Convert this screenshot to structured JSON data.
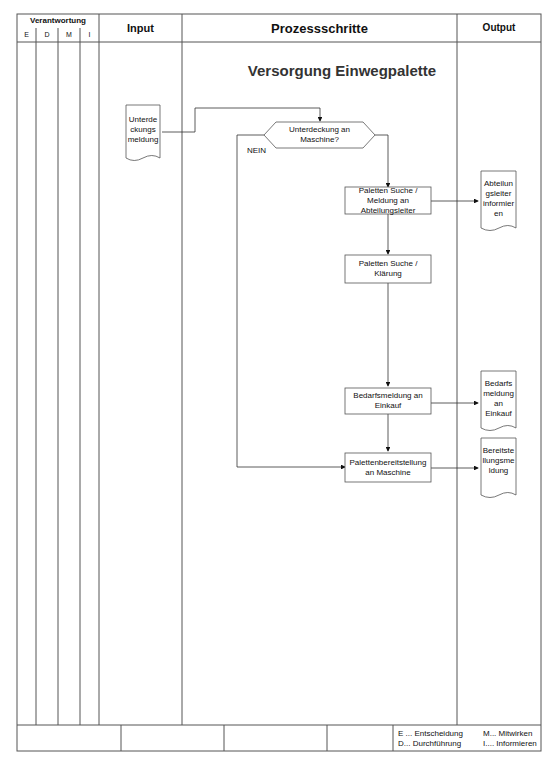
{
  "header": {
    "responsibility": "Verantwortung",
    "roles": [
      "E",
      "D",
      "M",
      "I"
    ],
    "input": "Input",
    "process": "Prozessschritte",
    "output": "Output"
  },
  "diagram": {
    "title": "Versorgung Einwegpalette",
    "input_document": "Unterde ckungs meldung",
    "decision": "Unterdeckung an Maschine?",
    "decision_no_label": "NEIN",
    "steps": [
      "Paletten Suche / Meldung an Abteilungsleiter",
      "Paletten Suche / Klärung",
      "Bedarfsmeldung an Einkauf",
      "Palettenbereitstellung an Maschine"
    ],
    "output_documents": [
      "Abteilun gsleiter informier en",
      "Bedarfs meldung an Einkauf",
      "Bereitste llungsme ldung"
    ]
  },
  "footer": {
    "legend": {
      "E": "E ... Entscheidung",
      "D": "D... Durchführung",
      "M": "M... Mitwirken",
      "I": "I.... Informieren"
    }
  }
}
